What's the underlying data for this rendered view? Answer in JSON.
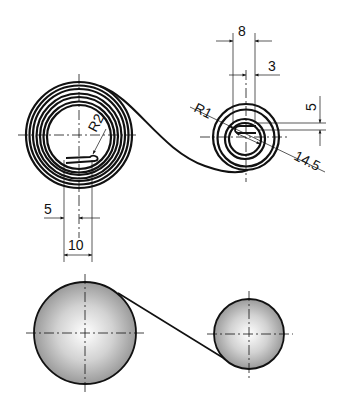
{
  "figure": {
    "views": [
      {
        "name": "spring-elevation",
        "description": "Wound spiral spring unwinding from large coil to small coil",
        "left_coil": {
          "turns": 7,
          "center": [
            79,
            135
          ],
          "outer_radius": 53,
          "inner_radius": 30
        },
        "right_coil": {
          "turns": 3,
          "center": [
            246,
            137
          ],
          "outer_radius": 33
        }
      },
      {
        "name": "drum-view",
        "description": "Two shaded cylinders (arbors) connected by tangent strip",
        "left_drum": {
          "center": [
            85,
            333
          ],
          "radius": 51
        },
        "right_drum": {
          "center": [
            249,
            334
          ],
          "radius": 35
        }
      }
    ],
    "dimensions": {
      "d8": "8",
      "d3": "3",
      "d5_right": "5",
      "r1": "R1",
      "d14_5": "14.5",
      "r2": "R2",
      "d5_left": "5",
      "d10": "10"
    }
  }
}
